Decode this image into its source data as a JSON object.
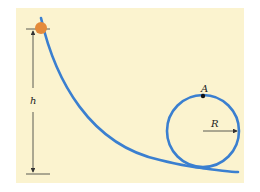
{
  "diagram": {
    "type": "loop-the-loop track",
    "labels": {
      "height": "h",
      "point": "A",
      "radius": "R"
    },
    "colors": {
      "background": "#fbf3cf",
      "track": "#3a7fd0",
      "ball": "#e48a3a",
      "lines": "#333333"
    },
    "elements": {
      "ball": {
        "cx": 41,
        "cy": 28,
        "r": 6
      },
      "loop": {
        "cx": 203,
        "cy": 131,
        "r": 36
      },
      "point_A": {
        "cx": 203,
        "cy": 95
      },
      "height_arrow": {
        "x": 33,
        "y_top": 28,
        "y_bottom": 174
      }
    }
  }
}
